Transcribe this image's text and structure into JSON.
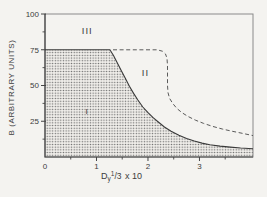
{
  "figure": {
    "y_axis_title": "B (ARBITRARY UNITS)",
    "x_axis_title": {
      "base": "D",
      "sub": "y",
      "frac_num": "1",
      "frac_slash": "/",
      "frac_den": "3",
      "suffix": " x 10"
    },
    "colors": {
      "background": "#f4f3f0",
      "axis": "#454545",
      "frame": "#8a8a8a",
      "solid_line": "#3a3a3a",
      "dashed_line": "#5a5a5a",
      "stipple_dot": "#696969",
      "stipple_bg": "#efede9",
      "text": "#3c3c3c"
    }
  },
  "chart_data": {
    "type": "area",
    "title": "",
    "xlabel": "Dy^(1/3) x 10",
    "ylabel": "B (ARBITRARY UNITS)",
    "xlim": [
      0,
      4.04
    ],
    "ylim": [
      0,
      100
    ],
    "grid": false,
    "x_axis": {
      "tick_labels": [
        0,
        1,
        2,
        3
      ],
      "tick_marks": [
        1,
        2,
        3
      ],
      "minor_ticks": [
        0.5,
        1.5,
        2.5,
        3.5
      ]
    },
    "y_axis": {
      "tick_labels": [
        25,
        50,
        75,
        100
      ],
      "tick_marks": [
        25,
        50,
        75,
        100
      ],
      "minor_ticks": [
        12.5,
        37.5,
        62.5,
        87.5
      ]
    },
    "regions": [
      {
        "label": "I",
        "x": 0.82,
        "y": 32,
        "size": 8,
        "note": "inside stippled area"
      },
      {
        "label": "II",
        "x": 1.95,
        "y": 59,
        "size": 9.5,
        "note": "between solid and dashed boundaries"
      },
      {
        "label": "III",
        "x": 0.82,
        "y": 88,
        "size": 9.5,
        "note": "above B=75 line"
      }
    ],
    "series": [
      {
        "name": "region-I-upper-boundary",
        "style": "solid",
        "filled_below": true,
        "points": [
          [
            0,
            75
          ],
          [
            1.26,
            75
          ],
          [
            1.33,
            71
          ],
          [
            1.4,
            66
          ],
          [
            1.48,
            60.5
          ],
          [
            1.56,
            55
          ],
          [
            1.64,
            49.5
          ],
          [
            1.72,
            44.5
          ],
          [
            1.8,
            40
          ],
          [
            1.9,
            35
          ],
          [
            2.0,
            31
          ],
          [
            2.1,
            27.5
          ],
          [
            2.2,
            24.5
          ],
          [
            2.32,
            21
          ],
          [
            2.45,
            18
          ],
          [
            2.6,
            15.2
          ],
          [
            2.75,
            13
          ],
          [
            2.9,
            11.2
          ],
          [
            3.05,
            9.7
          ],
          [
            3.2,
            8.6
          ],
          [
            3.4,
            7.6
          ],
          [
            3.6,
            6.9
          ],
          [
            3.8,
            6.3
          ],
          [
            4.04,
            5.8
          ]
        ]
      },
      {
        "name": "region-II-upper-boundary",
        "style": "dashed",
        "filled_below": false,
        "points": [
          [
            1.32,
            75
          ],
          [
            2.18,
            75
          ],
          [
            2.28,
            74
          ],
          [
            2.34,
            72
          ],
          [
            2.37,
            69
          ],
          [
            2.38,
            64
          ],
          [
            2.38,
            50
          ],
          [
            2.39,
            45
          ],
          [
            2.42,
            41
          ],
          [
            2.48,
            37.5
          ],
          [
            2.56,
            34
          ],
          [
            2.66,
            31
          ],
          [
            2.78,
            28.3
          ],
          [
            2.92,
            25.8
          ],
          [
            3.08,
            23.5
          ],
          [
            3.25,
            21.5
          ],
          [
            3.45,
            19.5
          ],
          [
            3.65,
            17.9
          ],
          [
            3.85,
            16.4
          ],
          [
            4.04,
            15
          ]
        ]
      }
    ]
  }
}
